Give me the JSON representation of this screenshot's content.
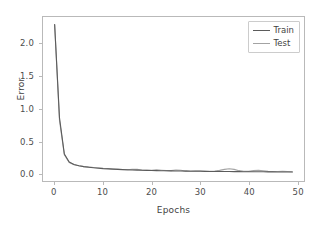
{
  "chart_data": {
    "type": "line",
    "title": "",
    "xlabel": "Epochs",
    "ylabel": "Error",
    "xlim": [
      -2.4,
      51.4
    ],
    "ylim": [
      -0.118,
      2.42
    ],
    "xticks": [
      0,
      10,
      20,
      30,
      40,
      50
    ],
    "xtick_labels": [
      "0",
      "10",
      "20",
      "30",
      "40",
      "50"
    ],
    "yticks": [
      0.0,
      0.5,
      1.0,
      1.5,
      2.0
    ],
    "ytick_labels": [
      "0.0",
      "0.5",
      "1.0",
      "1.5",
      "2.0"
    ],
    "grid": false,
    "legend_position": "upper right",
    "x": [
      0,
      1,
      2,
      3,
      4,
      5,
      6,
      7,
      8,
      9,
      10,
      11,
      12,
      13,
      14,
      15,
      16,
      17,
      18,
      19,
      20,
      21,
      22,
      23,
      24,
      25,
      26,
      27,
      28,
      29,
      30,
      31,
      32,
      33,
      34,
      35,
      36,
      37,
      38,
      39,
      40,
      41,
      42,
      43,
      44,
      45,
      46,
      47,
      48,
      49
    ],
    "series": [
      {
        "name": "Train",
        "color": "#5b5b5b",
        "linewidth": 1.1,
        "values": [
          2.305,
          0.86,
          0.3,
          0.175,
          0.138,
          0.118,
          0.104,
          0.094,
          0.086,
          0.079,
          0.073,
          0.069,
          0.065,
          0.061,
          0.058,
          0.055,
          0.053,
          0.05,
          0.048,
          0.046,
          0.044,
          0.043,
          0.041,
          0.04,
          0.038,
          0.037,
          0.036,
          0.035,
          0.034,
          0.033,
          0.032,
          0.031,
          0.03,
          0.03,
          0.029,
          0.028,
          0.028,
          0.027,
          0.027,
          0.026,
          0.025,
          0.025,
          0.024,
          0.024,
          0.023,
          0.023,
          0.022,
          0.022,
          0.021,
          0.021
        ]
      },
      {
        "name": "Test",
        "color": "#a3a3a3",
        "linewidth": 1.1,
        "values": [
          2.302,
          0.82,
          0.29,
          0.168,
          0.133,
          0.118,
          0.105,
          0.1,
          0.092,
          0.088,
          0.079,
          0.075,
          0.068,
          0.072,
          0.061,
          0.054,
          0.062,
          0.063,
          0.05,
          0.046,
          0.047,
          0.056,
          0.049,
          0.042,
          0.043,
          0.053,
          0.049,
          0.038,
          0.036,
          0.04,
          0.038,
          0.034,
          0.033,
          0.036,
          0.046,
          0.062,
          0.071,
          0.062,
          0.042,
          0.033,
          0.031,
          0.042,
          0.048,
          0.041,
          0.031,
          0.028,
          0.03,
          0.033,
          0.029,
          0.026
        ]
      }
    ]
  },
  "legend": {
    "entries": [
      {
        "label": "Train"
      },
      {
        "label": "Test"
      }
    ]
  },
  "axis": {
    "x_title": "Epochs",
    "y_title": "Error"
  }
}
